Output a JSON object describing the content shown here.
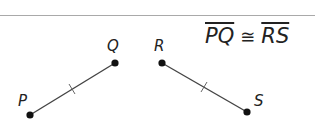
{
  "figure": {
    "points": {
      "P": {
        "label": "P",
        "x": 30,
        "y": 115
      },
      "Q": {
        "label": "Q",
        "x": 115,
        "y": 63
      },
      "R": {
        "label": "R",
        "x": 162,
        "y": 63
      },
      "S": {
        "label": "S",
        "x": 247,
        "y": 112
      }
    },
    "segments": [
      {
        "name": "PQ",
        "from": "P",
        "to": "Q",
        "tick_marks": 1
      },
      {
        "name": "RS",
        "from": "R",
        "to": "S",
        "tick_marks": 1
      }
    ],
    "statement": {
      "left": "PQ",
      "symbol": "≅",
      "right": "RS"
    },
    "colors": {
      "line": "#444444",
      "point": "#111111",
      "rule": "#a9a9a9"
    }
  }
}
